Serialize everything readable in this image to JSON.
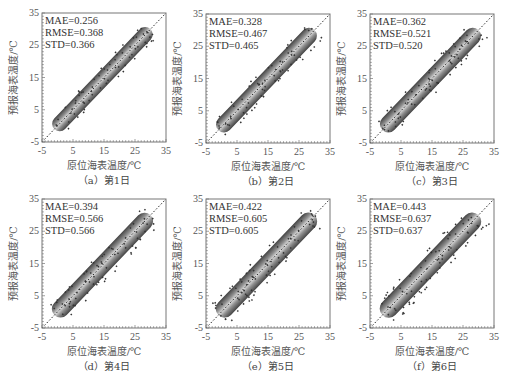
{
  "chart_data": [
    {
      "type": "scatter",
      "panel": "a",
      "caption": "（a）第1日",
      "xlabel": "原位海表温度/℃",
      "ylabel": "预报海表温度/℃",
      "xlim": [
        -5,
        35
      ],
      "ylim": [
        -5,
        35
      ],
      "xticks": [
        "-5",
        "5",
        "15",
        "25",
        "35"
      ],
      "yticks": [
        "-5",
        "5",
        "15",
        "25",
        "35"
      ],
      "stats": {
        "MAE": "MAE=0.256",
        "RMSE": "RMSE=0.368",
        "STD": "STD=0.366"
      },
      "reference_line": "y=x dotted",
      "spread": 1.0
    },
    {
      "type": "scatter",
      "panel": "b",
      "caption": "（b）第2日",
      "xlabel": "原位海表温度/℃",
      "ylabel": "预报海表温度/℃",
      "xlim": [
        -5,
        35
      ],
      "ylim": [
        -5,
        35
      ],
      "xticks": [
        "-5",
        "5",
        "15",
        "25",
        "35"
      ],
      "yticks": [
        "-5",
        "5",
        "15",
        "25",
        "35"
      ],
      "stats": {
        "MAE": "MAE=0.328",
        "RMSE": "RMSE=0.467",
        "STD": "STD=0.465"
      },
      "reference_line": "y=x dotted",
      "spread": 1.2
    },
    {
      "type": "scatter",
      "panel": "c",
      "caption": "（c）第3日",
      "xlabel": "原位海表温度/℃",
      "ylabel": "预报海表温度/℃",
      "xlim": [
        -5,
        35
      ],
      "ylim": [
        -5,
        35
      ],
      "xticks": [
        "-5",
        "5",
        "15",
        "25",
        "35"
      ],
      "yticks": [
        "-5",
        "5",
        "15",
        "25",
        "35"
      ],
      "stats": {
        "MAE": "MAE=0.362",
        "RMSE": "RMSE=0.521",
        "STD": "STD=0.520"
      },
      "reference_line": "y=x dotted",
      "spread": 1.35
    },
    {
      "type": "scatter",
      "panel": "d",
      "caption": "（d）第4日",
      "xlabel": "原位海表温度/℃",
      "ylabel": "预报海表温度/℃",
      "xlim": [
        -5,
        35
      ],
      "ylim": [
        -5,
        35
      ],
      "xticks": [
        "-5",
        "5",
        "15",
        "25",
        "35"
      ],
      "yticks": [
        "-5",
        "5",
        "15",
        "25",
        "35"
      ],
      "stats": {
        "MAE": "MAE=0.394",
        "RMSE": "RMSE=0.566",
        "STD": "STD=0.566"
      },
      "reference_line": "y=x dotted",
      "spread": 1.45
    },
    {
      "type": "scatter",
      "panel": "e",
      "caption": "（e）第5日",
      "xlabel": "原位海表温度/℃",
      "ylabel": "预报海表温度/℃",
      "xlim": [
        -5,
        35
      ],
      "ylim": [
        -5,
        35
      ],
      "xticks": [
        "-5",
        "5",
        "15",
        "25",
        "35"
      ],
      "yticks": [
        "-5",
        "5",
        "15",
        "25",
        "35"
      ],
      "stats": {
        "MAE": "MAE=0.422",
        "RMSE": "RMSE=0.605",
        "STD": "STD=0.605"
      },
      "reference_line": "y=x dotted",
      "spread": 1.55
    },
    {
      "type": "scatter",
      "panel": "f",
      "caption": "（f）第6日",
      "xlabel": "原位海表温度/℃",
      "ylabel": "预报海表温度/℃",
      "xlim": [
        -5,
        35
      ],
      "ylim": [
        -5,
        35
      ],
      "xticks": [
        "-5",
        "5",
        "15",
        "25",
        "35"
      ],
      "yticks": [
        "-5",
        "5",
        "15",
        "25",
        "35"
      ],
      "stats": {
        "MAE": "MAE=0.443",
        "RMSE": "RMSE=0.637",
        "STD": "STD=0.637"
      },
      "reference_line": "y=x dotted",
      "spread": 1.65
    }
  ],
  "colors": {
    "axis": "#777777",
    "cloud_edge": "#3a3a3a",
    "cloud_mid": "#8a8a8a",
    "cloud_core": "#d8d8d8",
    "ref_line": "#222222"
  }
}
